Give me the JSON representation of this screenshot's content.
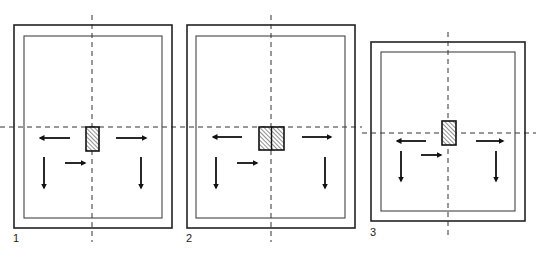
{
  "figure": {
    "panels": [
      {
        "label": "1",
        "outer": {
          "x": 14,
          "y": 25,
          "w": 158,
          "h": 203
        },
        "inner": {
          "x": 24,
          "y": 36,
          "w": 138,
          "h": 182
        },
        "axis_x": 92,
        "axis_y": 127,
        "block": {
          "x": 86,
          "y": 127,
          "w": 13,
          "h": 24,
          "split": false
        },
        "arrows": [
          {
            "dir": "left",
            "x1": 70,
            "y1": 138,
            "x2": 40,
            "y2": 138
          },
          {
            "dir": "right",
            "x1": 116,
            "y1": 138,
            "x2": 146,
            "y2": 138
          },
          {
            "dir": "down",
            "x1": 44,
            "y1": 157,
            "x2": 44,
            "y2": 188
          },
          {
            "dir": "down",
            "x1": 141,
            "y1": 157,
            "x2": 141,
            "y2": 188
          },
          {
            "dir": "right",
            "x1": 65,
            "y1": 163,
            "x2": 85,
            "y2": 163
          }
        ],
        "label_pos": {
          "x": 13,
          "y": 232
        }
      },
      {
        "label": "2",
        "outer": {
          "x": 187,
          "y": 25,
          "w": 168,
          "h": 203
        },
        "inner": {
          "x": 196,
          "y": 36,
          "w": 149,
          "h": 182
        },
        "axis_x": 271,
        "axis_y": 127,
        "block": {
          "x": 259,
          "y": 127,
          "w": 25,
          "h": 23,
          "split": true
        },
        "arrows": [
          {
            "dir": "left",
            "x1": 242,
            "y1": 137,
            "x2": 213,
            "y2": 137
          },
          {
            "dir": "right",
            "x1": 302,
            "y1": 137,
            "x2": 331,
            "y2": 137
          },
          {
            "dir": "down",
            "x1": 216,
            "y1": 157,
            "x2": 216,
            "y2": 188
          },
          {
            "dir": "down",
            "x1": 325,
            "y1": 157,
            "x2": 325,
            "y2": 188
          },
          {
            "dir": "right",
            "x1": 237,
            "y1": 163,
            "x2": 257,
            "y2": 163
          }
        ],
        "label_pos": {
          "x": 186,
          "y": 232
        }
      },
      {
        "label": "3",
        "outer": {
          "x": 371,
          "y": 42,
          "w": 154,
          "h": 179
        },
        "inner": {
          "x": 381,
          "y": 52,
          "w": 134,
          "h": 159
        },
        "axis_x": 448,
        "axis_y": 133,
        "block": {
          "x": 442,
          "y": 121,
          "w": 14,
          "h": 24,
          "split": false
        },
        "arrows": [
          {
            "dir": "left",
            "x1": 426,
            "y1": 141,
            "x2": 397,
            "y2": 141
          },
          {
            "dir": "right",
            "x1": 476,
            "y1": 141,
            "x2": 503,
            "y2": 141
          },
          {
            "dir": "down",
            "x1": 401,
            "y1": 151,
            "x2": 401,
            "y2": 181
          },
          {
            "dir": "down",
            "x1": 496,
            "y1": 151,
            "x2": 496,
            "y2": 181
          },
          {
            "dir": "right",
            "x1": 421,
            "y1": 155,
            "x2": 441,
            "y2": 155
          }
        ],
        "label_pos": {
          "x": 370,
          "y": 226
        }
      }
    ],
    "colors": {
      "line": "#222222",
      "inner_line": "#444444",
      "dash": "#333333",
      "hatch": "#555555"
    }
  }
}
